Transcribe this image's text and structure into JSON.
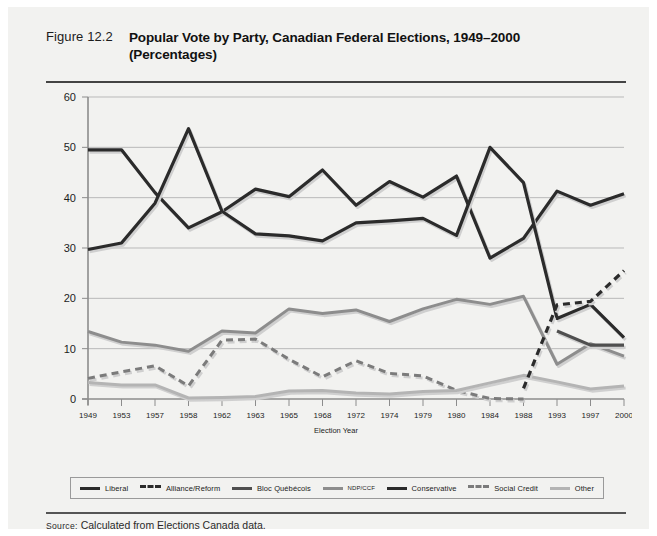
{
  "figure": {
    "number": "Figure 12.2",
    "title_line1": "Popular Vote by Party, Canadian Federal Elections, 1949–2000",
    "title_line2": "(Percentages)"
  },
  "source": {
    "label": "Source:",
    "text": " Calculated from Elections Canada data."
  },
  "legend": {
    "items": [
      {
        "label": "Liberal",
        "color": "#2b2b2b",
        "style": "solid",
        "size": "normal"
      },
      {
        "label": "Alliance/Reform",
        "color": "#2b2b2b",
        "style": "dashed",
        "size": "normal"
      },
      {
        "label": "Bloc Québécois",
        "color": "#4f4f4f",
        "style": "solid",
        "size": "normal"
      },
      {
        "label": "NDP/CCF",
        "color": "#8d8d8d",
        "style": "solid",
        "size": "tiny"
      },
      {
        "label": "Conservative",
        "color": "#2b2b2b",
        "style": "solid",
        "size": "normal"
      },
      {
        "label": "Social Credit",
        "color": "#7b7b7b",
        "style": "dashed",
        "size": "normal"
      },
      {
        "label": "Other",
        "color": "#b4b4b4",
        "style": "solid",
        "size": "normal"
      }
    ]
  },
  "chart_data": {
    "type": "line",
    "title": "Popular Vote by Party, Canadian Federal Elections, 1949–2000 (Percentages)",
    "xlabel": "Election Year",
    "ylabel": "",
    "ylim": [
      0,
      60
    ],
    "yticks": [
      0,
      10,
      20,
      30,
      40,
      50,
      60
    ],
    "grid": true,
    "legend_position": "bottom",
    "categories": [
      "1949",
      "1953",
      "1957",
      "1958",
      "1962",
      "1963",
      "1965",
      "1968",
      "1972",
      "1974",
      "1979",
      "1980",
      "1984",
      "1988",
      "1993",
      "1997",
      "2000"
    ],
    "series": [
      {
        "name": "Liberal",
        "color": "#2b2b2b",
        "style": "solid",
        "width": 3.2,
        "values": [
          49.5,
          49.5,
          41.0,
          34.0,
          37.2,
          41.7,
          40.2,
          45.5,
          38.5,
          43.2,
          40.1,
          44.3,
          28.0,
          31.9,
          41.3,
          38.5,
          40.8
        ]
      },
      {
        "name": "Conservative",
        "color": "#2b2b2b",
        "style": "solid",
        "width": 3.2,
        "values": [
          29.7,
          31.0,
          38.9,
          53.7,
          37.3,
          32.8,
          32.4,
          31.4,
          35.0,
          35.4,
          35.9,
          32.5,
          50.0,
          43.0,
          16.0,
          18.8,
          12.2
        ]
      },
      {
        "name": "NDP/CCF",
        "color": "#8d8d8d",
        "style": "solid",
        "width": 3.0,
        "values": [
          13.4,
          11.3,
          10.7,
          9.5,
          13.5,
          13.1,
          17.9,
          17.0,
          17.7,
          15.4,
          17.9,
          19.8,
          18.8,
          20.4,
          6.9,
          11.0,
          8.5
        ]
      },
      {
        "name": "Social Credit",
        "color": "#7b7b7b",
        "style": "dashed",
        "width": 3.0,
        "values": [
          4.1,
          5.4,
          6.6,
          2.6,
          11.7,
          11.9,
          7.9,
          4.4,
          7.6,
          5.1,
          4.6,
          1.7,
          0.1,
          0.0,
          null,
          null,
          null
        ]
      },
      {
        "name": "Other",
        "color": "#b4b4b4",
        "style": "solid",
        "width": 3.0,
        "values": [
          3.3,
          2.8,
          2.8,
          0.2,
          0.3,
          0.5,
          1.6,
          1.7,
          1.2,
          1.0,
          1.5,
          1.7,
          3.2,
          4.7,
          3.4,
          2.0,
          2.6
        ]
      },
      {
        "name": "Bloc Québécois",
        "color": "#4f4f4f",
        "style": "solid",
        "width": 3.2,
        "values": [
          null,
          null,
          null,
          null,
          null,
          null,
          null,
          null,
          null,
          null,
          null,
          null,
          null,
          null,
          13.5,
          10.7,
          10.7
        ]
      },
      {
        "name": "Alliance/Reform",
        "color": "#2b2b2b",
        "style": "dashed",
        "width": 3.2,
        "values": [
          null,
          null,
          null,
          null,
          null,
          null,
          null,
          null,
          null,
          null,
          null,
          null,
          null,
          2.1,
          18.7,
          19.4,
          25.5
        ]
      }
    ]
  }
}
